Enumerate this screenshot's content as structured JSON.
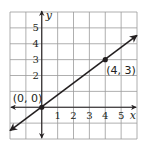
{
  "chart_data": {
    "type": "line",
    "title": "",
    "xlabel": "x",
    "ylabel": "y",
    "xlim": [
      -2,
      6
    ],
    "ylim": [
      -2,
      6
    ],
    "grid": true,
    "x_ticks": [
      "1",
      "2",
      "3",
      "4",
      "5"
    ],
    "y_ticks": [
      "2",
      "3",
      "4",
      "5"
    ],
    "series": [
      {
        "name": "line",
        "slope": 0.75,
        "intercept": 0,
        "arrows_both_ends": true,
        "points": [
          {
            "x": 0,
            "y": 0,
            "label": "(0, 0)"
          },
          {
            "x": 4,
            "y": 3,
            "label": "(4, 3)"
          }
        ]
      }
    ]
  },
  "colors": {
    "grid": "#9a9a9a",
    "axis": "#231f20",
    "line": "#231f20",
    "background": "#ffffff"
  }
}
